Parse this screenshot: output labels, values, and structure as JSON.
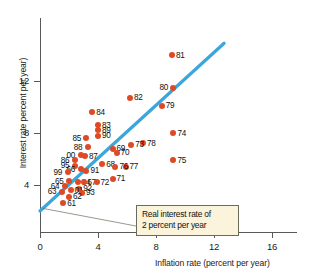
{
  "chart_data": {
    "type": "scatter",
    "title": "",
    "xlabel": "Inflation rate (percent per year)",
    "ylabel": "Interest rate percent per year)",
    "xlim": [
      0,
      18.5
    ],
    "ylim": [
      0,
      16.0
    ],
    "xticks": [
      0,
      4,
      8,
      12,
      16
    ],
    "yticks": [
      4,
      8,
      12
    ],
    "grid": false,
    "legend": null,
    "point_color": "#DE4A26",
    "line_color": "#3BA6DC",
    "annotation": {
      "line1": "Real interest rate of",
      "line2": "2 percent per year",
      "box_fill": "#FBF3DC",
      "box_border": "#6b6b5a"
    },
    "trend_line": {
      "label": "real interest rate of 2 percent per year",
      "x_start": 0.0,
      "y_start": 2.0,
      "x_end": 12.7,
      "y_end": 14.9
    },
    "points": [
      {
        "label": "81",
        "x": 9.1,
        "y": 14.0,
        "lx": "right"
      },
      {
        "label": "80",
        "x": 9.2,
        "y": 11.5,
        "lx": "left"
      },
      {
        "label": "82",
        "x": 6.2,
        "y": 10.7,
        "lx": "right"
      },
      {
        "label": "79",
        "x": 8.4,
        "y": 10.1,
        "lx": "right"
      },
      {
        "label": "84",
        "x": 3.6,
        "y": 9.6,
        "lx": "right"
      },
      {
        "label": "83",
        "x": 4.0,
        "y": 8.6,
        "lx": "right"
      },
      {
        "label": "89",
        "x": 4.0,
        "y": 8.2,
        "lx": "right"
      },
      {
        "label": "74",
        "x": 9.2,
        "y": 8.0,
        "lx": "right"
      },
      {
        "label": "90",
        "x": 4.0,
        "y": 7.8,
        "lx": "right"
      },
      {
        "label": "85",
        "x": 3.2,
        "y": 7.6,
        "lx": "left"
      },
      {
        "label": "78",
        "x": 7.1,
        "y": 7.2,
        "lx": "right"
      },
      {
        "label": "73",
        "x": 6.3,
        "y": 7.1,
        "lx": "right"
      },
      {
        "label": "88",
        "x": 3.3,
        "y": 6.9,
        "lx": "left"
      },
      {
        "label": "69",
        "x": 5.0,
        "y": 6.8,
        "lx": "right"
      },
      {
        "label": "70",
        "x": 5.3,
        "y": 6.5,
        "lx": "right"
      },
      {
        "label": "87",
        "x": 3.1,
        "y": 6.2,
        "lx": "right"
      },
      {
        "label": "00",
        "x": 2.8,
        "y": 6.3,
        "lx": "left"
      },
      {
        "label": "75",
        "x": 9.2,
        "y": 5.9,
        "lx": "right"
      },
      {
        "label": "86",
        "x": 2.4,
        "y": 5.9,
        "lx": "left"
      },
      {
        "label": "68",
        "x": 4.3,
        "y": 5.6,
        "lx": "right"
      },
      {
        "label": "95",
        "x": 2.4,
        "y": 5.5,
        "lx": "left"
      },
      {
        "label": "77",
        "x": 5.9,
        "y": 5.4,
        "lx": "right"
      },
      {
        "label": "76",
        "x": 5.2,
        "y": 5.4,
        "lx": "right"
      },
      {
        "label": "66",
        "x": 2.8,
        "y": 5.2,
        "lx": "left"
      },
      {
        "label": "91",
        "x": 3.2,
        "y": 5.1,
        "lx": "right"
      },
      {
        "label": "99",
        "x": 1.9,
        "y": 5.0,
        "lx": "left"
      },
      {
        "label": "71",
        "x": 5.0,
        "y": 4.5,
        "lx": "right"
      },
      {
        "label": "65",
        "x": 2.0,
        "y": 4.3,
        "lx": "left"
      },
      {
        "label": "94",
        "x": 2.6,
        "y": 4.2,
        "lx": "right"
      },
      {
        "label": "67",
        "x": 3.0,
        "y": 4.2,
        "lx": "right"
      },
      {
        "label": "72",
        "x": 3.9,
        "y": 4.2,
        "lx": "right"
      },
      {
        "label": "64",
        "x": 1.7,
        "y": 3.9,
        "lx": "left"
      },
      {
        "label": "92",
        "x": 2.7,
        "y": 3.7,
        "lx": "right"
      },
      {
        "label": "63",
        "x": 1.5,
        "y": 3.5,
        "lx": "left"
      },
      {
        "label": "01",
        "x": 2.1,
        "y": 3.6,
        "lx": "right"
      },
      {
        "label": "93",
        "x": 2.9,
        "y": 3.4,
        "lx": "right"
      },
      {
        "label": "62",
        "x": 2.0,
        "y": 3.1,
        "lx": "right"
      },
      {
        "label": "61",
        "x": 1.6,
        "y": 2.6,
        "lx": "right"
      }
    ]
  }
}
